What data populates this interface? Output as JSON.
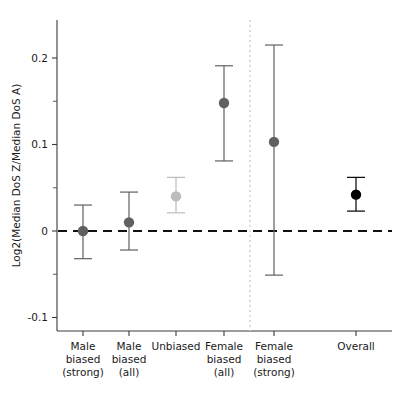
{
  "chart_data": {
    "type": "scatter",
    "title": "",
    "xlabel": "",
    "ylabel": "Log2(Median DoS Z/Median DoS A)",
    "ylim": [
      -0.108,
      0.243
    ],
    "yticks": [
      0.2,
      0.1,
      0.0,
      -0.1
    ],
    "ytick_labels": [
      "0.2",
      "0.1",
      "0",
      "-0.1"
    ],
    "yminor_ticks": [
      0.15,
      0.05,
      -0.05
    ],
    "grid": false,
    "legend": null,
    "reference_line": {
      "y": 0.0,
      "style": "dashed",
      "color": "#111111"
    },
    "separator_line": {
      "after_category_index": 4,
      "style": "dotted",
      "color": "#cfcfcf"
    },
    "categories": [
      "Male biased (strong)",
      "Male biased (all)",
      "Unbiased",
      "Female biased (all)",
      "Female biased (strong)",
      "Overall"
    ],
    "category_labels": [
      [
        "Male",
        "biased",
        "(strong)"
      ],
      [
        "Male",
        "biased",
        "(all)"
      ],
      [
        "Unbiased"
      ],
      [
        "Female",
        "biased",
        "(all)"
      ],
      [
        "Female",
        "biased",
        "(strong)"
      ],
      [
        "Overall"
      ]
    ],
    "points": [
      {
        "category": "Male biased (strong)",
        "value": 0.0,
        "ci_low": -0.032,
        "ci_high": 0.03,
        "color": "#606060"
      },
      {
        "category": "Male biased (all)",
        "value": 0.01,
        "ci_low": -0.022,
        "ci_high": 0.045,
        "color": "#606060"
      },
      {
        "category": "Unbiased",
        "value": 0.04,
        "ci_low": 0.021,
        "ci_high": 0.062,
        "color": "#bcbcbc"
      },
      {
        "category": "Female biased (all)",
        "value": 0.148,
        "ci_low": 0.081,
        "ci_high": 0.191,
        "color": "#606060"
      },
      {
        "category": "Female biased (strong)",
        "value": 0.103,
        "ci_low": -0.051,
        "ci_high": 0.215,
        "color": "#606060"
      },
      {
        "category": "Overall",
        "value": 0.042,
        "ci_low": 0.023,
        "ci_high": 0.062,
        "color": "#000000"
      }
    ]
  }
}
